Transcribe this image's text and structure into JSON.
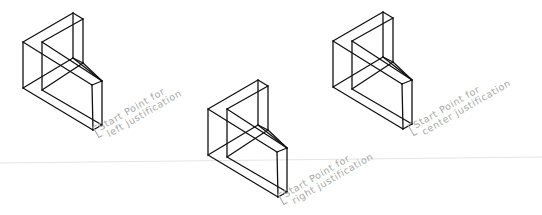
{
  "diagram": {
    "figures": [
      {
        "id": "left",
        "label_line1": "Start Point for",
        "label_line2": "left justification"
      },
      {
        "id": "right",
        "label_line1": "Start Point for",
        "label_line2": "right justification"
      },
      {
        "id": "center",
        "label_line1": "Start Point for",
        "label_line2": "center justification"
      }
    ],
    "colors": {
      "edges": "#111111",
      "labels": "#a8a8a8"
    }
  }
}
